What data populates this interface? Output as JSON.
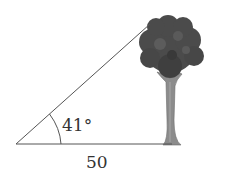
{
  "diagram": {
    "angle_label": "41°",
    "base_label": "50",
    "colors": {
      "line": "#555555",
      "crown": "#4a4a4a",
      "crown_dark": "#333333",
      "trunk": "#8a8a8a",
      "text": "#333333"
    }
  }
}
